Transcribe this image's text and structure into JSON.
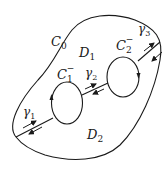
{
  "diagram": {
    "colors": {
      "stroke": "#1a1a1a",
      "background": "#ffffff"
    },
    "contours": {
      "outer": {
        "name": "C",
        "sub": "0"
      },
      "inner1": {
        "name": "C",
        "sub": "1",
        "sup": "−"
      },
      "inner2": {
        "name": "C",
        "sub": "2",
        "sup": "−"
      }
    },
    "regions": {
      "d1": {
        "name": "D",
        "sub": "1"
      },
      "d2": {
        "name": "D",
        "sub": "2"
      }
    },
    "cuts": {
      "g1": {
        "name": "γ",
        "sub": "1"
      },
      "g2": {
        "name": "γ",
        "sub": "2"
      },
      "g3": {
        "name": "γ",
        "sub": "3"
      }
    }
  }
}
